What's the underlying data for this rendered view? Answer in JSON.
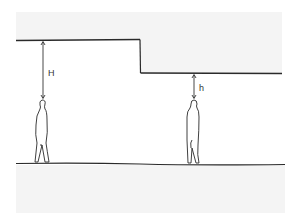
{
  "diagram": {
    "title": "",
    "labels": {
      "tall_clearance": "H",
      "low_clearance": "h"
    },
    "colors": {
      "line": "#2a2a2a",
      "shade": "#f3f3f3",
      "background": "#ffffff"
    },
    "elements": [
      {
        "name": "high-ceiling",
        "description": "Higher ceiling section on the left"
      },
      {
        "name": "low-ceiling",
        "description": "Lower ceiling section on the right"
      },
      {
        "name": "floor",
        "description": "Continuous floor line"
      },
      {
        "name": "person-left",
        "description": "Standing human figure under high ceiling"
      },
      {
        "name": "person-right",
        "description": "Standing human figure under low ceiling"
      }
    ]
  }
}
